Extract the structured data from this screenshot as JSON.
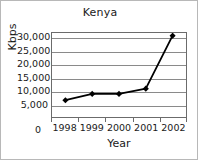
{
  "chart_data": {
    "type": "line",
    "title": "Kenya",
    "xlabel": "Year",
    "ylabel": "Kbps",
    "categories": [
      "1998",
      "1999",
      "2000",
      "2001",
      "2002"
    ],
    "values": [
      6400,
      8800,
      8800,
      10800,
      31000
    ],
    "series": [
      {
        "name": "Kbps",
        "values": [
          6400,
          8800,
          8800,
          10800,
          31000
        ]
      }
    ],
    "ylim": [
      0,
      32000
    ],
    "ytick_labels": [
      "30,000",
      "25,000",
      "20,000",
      "15,000",
      "10,000",
      "5,000"
    ],
    "ytick_values": [
      30000,
      25000,
      20000,
      15000,
      10000,
      5000
    ],
    "y_origin_label": "0",
    "grid": true,
    "legend": false,
    "legend_position": "none",
    "marker": "diamond",
    "line_color": "#000000",
    "marker_color": "#000000",
    "grid_color": "#8a8a8a",
    "plot_background": "#ffffff",
    "frame_color": "#6b6b6b"
  }
}
